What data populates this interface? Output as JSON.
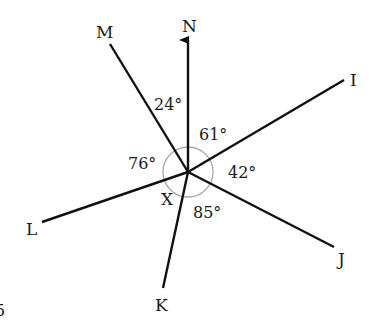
{
  "diagram": {
    "center": {
      "label": "X"
    },
    "rays": [
      {
        "label": "N",
        "arrow": true
      },
      {
        "label": "I"
      },
      {
        "label": "J"
      },
      {
        "label": "K"
      },
      {
        "label": "L"
      },
      {
        "label": "M"
      }
    ],
    "angles": [
      {
        "between": "M-N",
        "value": "24°"
      },
      {
        "between": "N-I",
        "value": "61°"
      },
      {
        "between": "I-J",
        "value": "42°"
      },
      {
        "between": "J-K",
        "value": "85°"
      },
      {
        "between": "L-M",
        "value": "76°"
      }
    ],
    "edge_fragment": "5"
  }
}
